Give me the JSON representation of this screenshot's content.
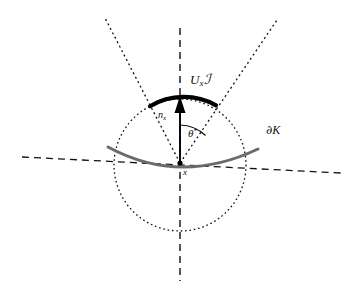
{
  "figure": {
    "background_color": "#ffffff",
    "width": 353,
    "height": 292
  },
  "labels": {
    "cone": {
      "base": "U",
      "subscript": "x",
      "operator": "ℐ"
    },
    "normal_vector": {
      "base": "n",
      "subscript": "x"
    },
    "angle": {
      "base": "θ",
      "superscript": "*"
    },
    "boundary": {
      "partial": "∂",
      "set": "K"
    },
    "point": {
      "name": "x"
    }
  },
  "geometry": {
    "center": {
      "x": 180,
      "y": 163
    },
    "circle": {
      "cx": 180,
      "cy": 165,
      "r": 66,
      "style": "dotted",
      "color": "#111111"
    },
    "vertical_axis": {
      "x1": 180,
      "y1": 28,
      "x2": 180,
      "y2": 281,
      "style": "dashed",
      "color": "#111111"
    },
    "cone_ray_left": {
      "x1": 180,
      "y1": 163,
      "x2": 105,
      "y2": 18,
      "style": "dotted",
      "color": "#111111"
    },
    "cone_ray_right": {
      "x1": 180,
      "y1": 163,
      "x2": 277,
      "y2": 20,
      "style": "dotted",
      "color": "#111111"
    },
    "bold_arc": {
      "start_angle_deg": 117,
      "end_angle_deg": 57,
      "color": "#000000",
      "width": 4
    },
    "normal_arrow": {
      "x1": 180,
      "y1": 163,
      "x2": 180,
      "y2": 100,
      "color": "#000000"
    },
    "angle_arc": {
      "radius": 38,
      "from": "vertical",
      "to": "cone_ray_right",
      "color": "#111111"
    },
    "boundary_curve": {
      "color": "#6b6b6b",
      "width": 3,
      "left_x": 108,
      "right_x": 258,
      "sag": 18
    },
    "tangent_line": {
      "x1": 22,
      "y1": 157,
      "x2": 341,
      "y2": 173,
      "style": "dashed",
      "color": "#111111"
    }
  },
  "colors": {
    "ink": "#111111",
    "bold_ink": "#000000",
    "boundary_gray": "#6b6b6b",
    "page": "#ffffff"
  }
}
